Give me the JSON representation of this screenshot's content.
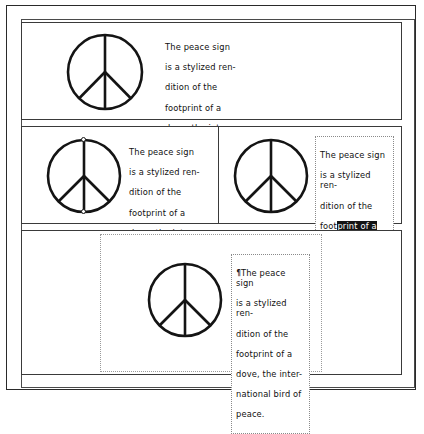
{
  "document": {
    "title": "Peace sign layout examples",
    "background": "#ffffff",
    "ink_color": "#111111",
    "selection_color": "#141414",
    "selection_text_color": "#ffffff"
  },
  "caption_text": "The peace sign is a stylized rendition of the footprint of a dove, the international bird of peace.",
  "panels": [
    {
      "id": "panel-top",
      "name": "top-example",
      "graphic": "peace-sign-icon",
      "text_lines": [
        "The peace sign",
        "is a stylized ren-",
        "dition of the",
        "footprint of a",
        "dove, the inter-",
        "national bird of",
        "peace."
      ]
    },
    {
      "id": "panel-middle-left",
      "name": "middle-left-example",
      "graphic": "peace-sign-icon",
      "graphic_state": "selected-with-handles",
      "text_lines": [
        "The peace sign",
        "is a stylized ren-",
        "dition of the",
        "footprint of a",
        "dove, the inter-",
        "national bird of",
        "peace."
      ]
    },
    {
      "id": "panel-middle-right",
      "name": "middle-right-example",
      "graphic": "peace-sign-icon",
      "text_box_border": "dotted",
      "text_lines": [
        "The peace sign",
        "is a stylized ren-",
        "dition of the",
        "footprint of a",
        "dove, the inter-",
        "national bird of",
        "peace."
      ],
      "selection": {
        "line_3_plain": "foot",
        "line_3_selected": "print of a",
        "line_4_selected": "dove, the inter-",
        "line_5_selected": "national bird of",
        "line_6_selected": "peace",
        "line_6_plain": "."
      }
    },
    {
      "id": "panel-bottom",
      "name": "bottom-example",
      "graphic": "peace-sign-icon",
      "container_border": "dotted",
      "text_box_border": "dotted",
      "caret_glyph": "pilcrow-caret-icon",
      "caret_char": "¶",
      "text_lines": [
        "The peace sign",
        "is a stylized ren-",
        "dition of the",
        "footprint of a",
        "dove, the inter-",
        "national bird of",
        "peace."
      ]
    }
  ]
}
